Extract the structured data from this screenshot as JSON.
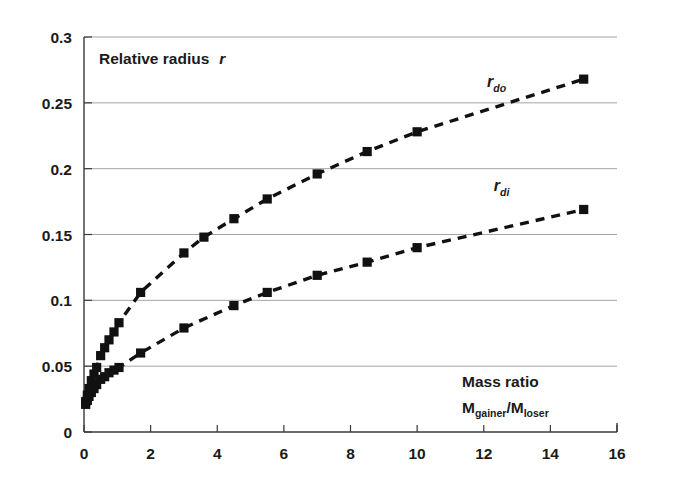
{
  "chart_data": {
    "type": "scatter",
    "title": "",
    "plot_annotation": "Relative radius",
    "plot_annotation_symbol": "r",
    "xlabel_line1": "Mass ratio",
    "xlabel_line2_main": "M",
    "xlabel_line2_sub1": "gainer",
    "xlabel_line2_slash": "/M",
    "xlabel_line2_sub2": "loser",
    "xlabel": "Mass ratio Mgainer/Mloser",
    "ylabel": "Relative radius r",
    "xlim": [
      0,
      16
    ],
    "ylim": [
      0,
      0.3
    ],
    "xticks": [
      0,
      2,
      4,
      6,
      8,
      10,
      12,
      14,
      16
    ],
    "xticklabels": [
      "0",
      "2",
      "4",
      "6",
      "8",
      "10",
      "12",
      "14",
      "16"
    ],
    "yticks": [
      0,
      0.05,
      0.1,
      0.15,
      0.2,
      0.25,
      0.3
    ],
    "yticklabels": [
      "0",
      "0.05",
      "0.1",
      "0.15",
      "0.2",
      "0.25",
      "0.3"
    ],
    "grid": "horizontal",
    "grid_color": "#9a9a9a",
    "axis_color": "#3a3a3a",
    "marker": "square",
    "marker_color": "#111111",
    "line_style": "dashed",
    "legend_position": "inline-annotation",
    "series": [
      {
        "name": "r_do",
        "label_main": "r",
        "label_sub": "do",
        "label_x": 12.1,
        "label_y": 0.262,
        "x": [
          0.05,
          0.1,
          0.15,
          0.22,
          0.3,
          0.38,
          0.5,
          0.62,
          0.75,
          0.9,
          1.05,
          1.7,
          3.0,
          3.6,
          4.5,
          5.5,
          7.0,
          8.5,
          10.0,
          15.0
        ],
        "y": [
          0.023,
          0.028,
          0.033,
          0.039,
          0.044,
          0.049,
          0.058,
          0.064,
          0.07,
          0.076,
          0.083,
          0.106,
          0.136,
          0.148,
          0.162,
          0.177,
          0.196,
          0.213,
          0.228,
          0.268
        ]
      },
      {
        "name": "r_di",
        "label_main": "r",
        "label_sub": "di",
        "label_x": 12.3,
        "label_y": 0.183,
        "x": [
          0.05,
          0.1,
          0.15,
          0.22,
          0.3,
          0.38,
          0.5,
          0.62,
          0.75,
          0.9,
          1.05,
          1.7,
          3.0,
          4.5,
          5.5,
          7.0,
          8.5,
          10.0,
          15.0
        ],
        "y": [
          0.021,
          0.024,
          0.027,
          0.03,
          0.033,
          0.036,
          0.04,
          0.042,
          0.045,
          0.047,
          0.049,
          0.06,
          0.079,
          0.096,
          0.106,
          0.119,
          0.129,
          0.14,
          0.169
        ]
      }
    ]
  }
}
